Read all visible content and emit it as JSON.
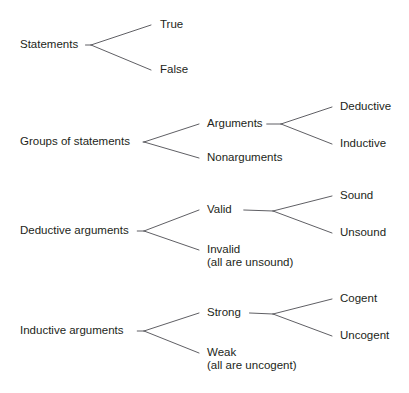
{
  "diagram": {
    "type": "tree-diagram",
    "background_color": "#ffffff",
    "text_color": "#231f20",
    "line_color": "#4d4d52",
    "groups": [
      {
        "id": "statements",
        "root": {
          "label": "Statements",
          "x": 20,
          "y": 45,
          "anchor": "start"
        },
        "apex": {
          "x": 91,
          "y": 45
        },
        "children": [
          {
            "label": "True",
            "x": 160,
            "y": 25,
            "anchor": "start",
            "elbow_x": 151,
            "elbow_y": 25
          },
          {
            "label": "False",
            "x": 160,
            "y": 70,
            "anchor": "start",
            "elbow_x": 151,
            "elbow_y": 70
          }
        ]
      },
      {
        "id": "groups-of-statements",
        "root": {
          "label": "Groups of statements",
          "x": 20,
          "y": 142,
          "anchor": "start"
        },
        "apex": {
          "x": 144,
          "y": 142
        },
        "children": [
          {
            "label": "Arguments",
            "x": 207,
            "y": 124,
            "anchor": "start",
            "elbow_x": 199,
            "elbow_y": 124
          },
          {
            "label": "Nonarguments",
            "x": 207,
            "y": 158,
            "anchor": "start",
            "elbow_x": 199,
            "elbow_y": 158
          }
        ],
        "sub": {
          "parent": "Arguments",
          "apex": {
            "x": 281,
            "y": 124
          },
          "children": [
            {
              "label": "Deductive",
              "x": 340,
              "y": 107,
              "anchor": "start",
              "elbow_x": 332,
              "elbow_y": 107
            },
            {
              "label": "Inductive",
              "x": 340,
              "y": 144,
              "anchor": "start",
              "elbow_x": 332,
              "elbow_y": 144
            }
          ]
        }
      },
      {
        "id": "deductive-arguments",
        "root": {
          "label": "Deductive arguments",
          "x": 20,
          "y": 231,
          "anchor": "start"
        },
        "apex": {
          "x": 144,
          "y": 231
        },
        "children": [
          {
            "label": "Valid",
            "x": 207,
            "y": 210,
            "anchor": "start",
            "elbow_x": 199,
            "elbow_y": 210
          },
          {
            "label": "Invalid",
            "x": 207,
            "y": 250,
            "anchor": "start",
            "elbow_x": 199,
            "elbow_y": 250,
            "sublabel": "(all are unsound)",
            "sublabel_y": 263
          }
        ],
        "sub": {
          "parent": "Valid",
          "apex": {
            "x": 273,
            "y": 211
          },
          "children": [
            {
              "label": "Sound",
              "x": 340,
              "y": 196,
              "anchor": "start",
              "elbow_x": 332,
              "elbow_y": 196
            },
            {
              "label": "Unsound",
              "x": 340,
              "y": 233,
              "anchor": "start",
              "elbow_x": 332,
              "elbow_y": 233
            }
          ]
        }
      },
      {
        "id": "inductive-arguments",
        "root": {
          "label": "Inductive arguments",
          "x": 20,
          "y": 331,
          "anchor": "start"
        },
        "apex": {
          "x": 144,
          "y": 331
        },
        "children": [
          {
            "label": "Strong",
            "x": 207,
            "y": 313,
            "anchor": "start",
            "elbow_x": 199,
            "elbow_y": 313
          },
          {
            "label": "Weak",
            "x": 207,
            "y": 353,
            "anchor": "start",
            "elbow_x": 199,
            "elbow_y": 353,
            "sublabel": "(all are uncogent)",
            "sublabel_y": 366
          }
        ],
        "sub": {
          "parent": "Strong",
          "apex": {
            "x": 273,
            "y": 314
          },
          "children": [
            {
              "label": "Cogent",
              "x": 340,
              "y": 299,
              "anchor": "start",
              "elbow_x": 332,
              "elbow_y": 299
            },
            {
              "label": "Uncogent",
              "x": 340,
              "y": 336,
              "anchor": "start",
              "elbow_x": 332,
              "elbow_y": 336
            }
          ]
        }
      }
    ]
  }
}
